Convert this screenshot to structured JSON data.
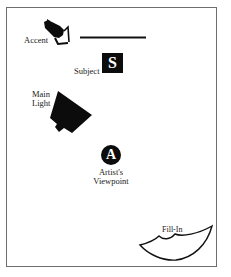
{
  "diagram": {
    "type": "lighting-setup",
    "colors": {
      "frame": "#6e6e6e",
      "ink": "#0c0c0c",
      "background": "#ffffff"
    },
    "elements": {
      "accent": {
        "label": "Accent",
        "icon": "accent-light-icon"
      },
      "backdrop": {
        "icon": "backdrop-line"
      },
      "subject": {
        "label": "Subject",
        "symbol": "S"
      },
      "main_light": {
        "label_line1": "Main",
        "label_line2": "Light",
        "icon": "main-light-icon"
      },
      "artist": {
        "symbol": "A",
        "label_line1": "Artist's",
        "label_line2": "Viewpoint"
      },
      "fill_in": {
        "label": "Fill-In",
        "icon": "fill-in-reflector-icon"
      }
    }
  }
}
